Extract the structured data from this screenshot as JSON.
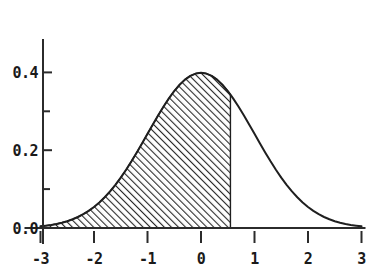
{
  "chart_data": {
    "type": "area",
    "title": "",
    "subtitle": "",
    "xlabel": "",
    "ylabel": "",
    "xlim": [
      -3,
      3
    ],
    "ylim": [
      0.0,
      0.45
    ],
    "grid": false,
    "legend": false,
    "legend_position": "none",
    "distribution": "standard normal (mean 0, sd 1)",
    "x_ticks": [
      -3,
      -2,
      -1,
      0,
      1,
      2,
      3
    ],
    "x_tick_labels": [
      "-3",
      "-2",
      "-1",
      "0",
      "1",
      "2",
      "3"
    ],
    "y_ticks": [
      0.0,
      0.2,
      0.4
    ],
    "y_tick_labels": [
      "0.0",
      "0.2",
      "0.4"
    ],
    "y_minor_ticks": [
      0.1,
      0.3
    ],
    "annotations": [
      {
        "name": "shaded-area-boundary",
        "type": "vertical-boundary",
        "x": 0.55,
        "y_top": 0.3429,
        "description": "right edge of shaded region"
      }
    ],
    "series": [
      {
        "name": "standard normal density",
        "style": "line",
        "color": "#1f1f1f",
        "x": [
          -3.0,
          -2.9,
          -2.8,
          -2.7,
          -2.6,
          -2.5,
          -2.4,
          -2.3,
          -2.2,
          -2.1,
          -2.0,
          -1.9,
          -1.8,
          -1.7,
          -1.6,
          -1.5,
          -1.4,
          -1.3,
          -1.2,
          -1.1,
          -1.0,
          -0.9,
          -0.8,
          -0.7,
          -0.6,
          -0.5,
          -0.4,
          -0.3,
          -0.2,
          -0.1,
          0.0,
          0.1,
          0.2,
          0.3,
          0.4,
          0.5,
          0.55,
          0.6,
          0.7,
          0.8,
          0.9,
          1.0,
          1.1,
          1.2,
          1.3,
          1.4,
          1.5,
          1.6,
          1.7,
          1.8,
          1.9,
          2.0,
          2.1,
          2.2,
          2.3,
          2.4,
          2.5,
          2.6,
          2.7,
          2.8,
          2.9,
          3.0
        ],
        "values": [
          0.0044,
          0.006,
          0.0079,
          0.0104,
          0.0136,
          0.0175,
          0.0224,
          0.0283,
          0.0355,
          0.044,
          0.054,
          0.0656,
          0.079,
          0.094,
          0.1109,
          0.1295,
          0.1497,
          0.1714,
          0.1942,
          0.2179,
          0.242,
          0.2661,
          0.2897,
          0.3123,
          0.3332,
          0.3521,
          0.3683,
          0.3814,
          0.391,
          0.397,
          0.3989,
          0.397,
          0.391,
          0.3814,
          0.3683,
          0.3521,
          0.3429,
          0.3332,
          0.3123,
          0.2897,
          0.2661,
          0.242,
          0.2179,
          0.1942,
          0.1714,
          0.1497,
          0.1295,
          0.1109,
          0.094,
          0.079,
          0.0656,
          0.054,
          0.044,
          0.0355,
          0.0283,
          0.0224,
          0.0175,
          0.0136,
          0.0104,
          0.0079,
          0.006,
          0.0044
        ]
      }
    ],
    "shaded_area": {
      "name": "cumulative probability region",
      "fill_pattern": "diagonal-hatch",
      "fill_color": "#9a9a9a",
      "hatch_color": "#1f1f1f",
      "x_from": -3.0,
      "x_to": 0.55
    },
    "colors": {
      "background": "#ffffff",
      "axis": "#2b2b2b",
      "curve": "#1f1f1f",
      "label": "#1a1a1a",
      "hatch": "#2a2a2a"
    }
  }
}
